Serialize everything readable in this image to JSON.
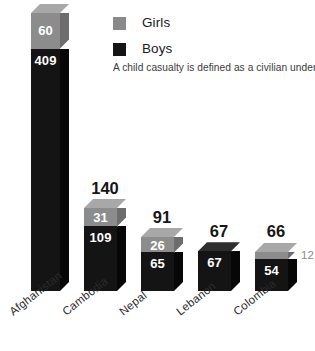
{
  "legend": {
    "items": [
      {
        "label": "Girls",
        "color": "#8a8a8a",
        "icon": "legend-swatch-girls"
      },
      {
        "label": "Boys",
        "color": "#141414",
        "icon": "legend-swatch-boys"
      }
    ]
  },
  "note": "A child casualty is defined as a civilian under 18",
  "chart_data": {
    "type": "bar",
    "title": "",
    "subtitle": "",
    "xlabel": "",
    "ylabel": "",
    "stacked": true,
    "grid": false,
    "legend_position": "top-right",
    "ylim": [
      0,
      469
    ],
    "categories": [
      "Afghanistan",
      "Cambodia",
      "Nepal",
      "Lebanon",
      "Colombia"
    ],
    "series": [
      {
        "name": "Girls",
        "color": "#8a8a8a",
        "values": [
          60,
          31,
          26,
          0,
          12
        ]
      },
      {
        "name": "Boys",
        "color": "#141414",
        "values": [
          409,
          109,
          65,
          67,
          54
        ]
      }
    ],
    "totals": [
      469,
      140,
      91,
      67,
      66
    ],
    "annotations": [
      "A child casualty is defined as a civilian under 18"
    ]
  },
  "bars": [
    {
      "category": "Afghanistan",
      "total": "469",
      "girls": "60",
      "boys": "409",
      "girls_label_outside": false
    },
    {
      "category": "Cambodia",
      "total": "140",
      "girls": "31",
      "boys": "109",
      "girls_label_outside": false
    },
    {
      "category": "Nepal",
      "total": "91",
      "girls": "26",
      "boys": "65",
      "girls_label_outside": false
    },
    {
      "category": "Lebanon",
      "total": "67",
      "girls": "",
      "boys": "67",
      "girls_label_outside": false
    },
    {
      "category": "Colombia",
      "total": "66",
      "girls": "12",
      "boys": "54",
      "girls_label_outside": true
    }
  ]
}
